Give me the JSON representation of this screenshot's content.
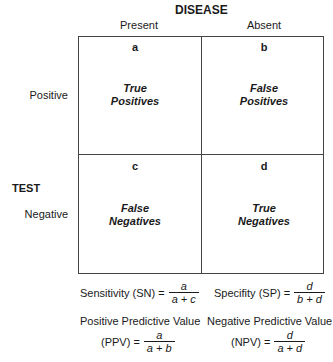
{
  "header": {
    "disease": "DISEASE",
    "test": "TEST"
  },
  "columns": [
    {
      "label": "Present"
    },
    {
      "label": "Absent"
    }
  ],
  "rows": [
    {
      "label": "Positive"
    },
    {
      "label": "Negative"
    }
  ],
  "cells": [
    {
      "letter": "a",
      "line1": "True",
      "line2": "Positives"
    },
    {
      "letter": "b",
      "line1": "False",
      "line2": "Positives"
    },
    {
      "letter": "c",
      "line1": "False",
      "line2": "Negatives"
    },
    {
      "letter": "d",
      "line1": "True",
      "line2": "Negatives"
    }
  ],
  "formulas": {
    "sensitivity": {
      "label": "Sensitivity (SN) =",
      "num": "a",
      "den": "a + c"
    },
    "specificity": {
      "label": "Specifity (SP) =",
      "num": "d",
      "den": "b + d"
    },
    "ppv": {
      "title": "Positive Predictive Value",
      "label": "(PPV) =",
      "num": "a",
      "den": "a + b"
    },
    "npv": {
      "title": "Negative Predictive Value",
      "label": "(NPV) =",
      "num": "d",
      "den": "a + d"
    }
  }
}
